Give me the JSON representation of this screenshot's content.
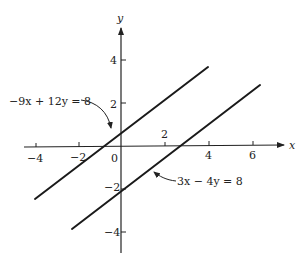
{
  "figure": {
    "axes": {
      "x_label": "x",
      "y_label": "y",
      "x_ticks": [
        {
          "value": -4,
          "label": "−4"
        },
        {
          "value": -2,
          "label": "−2"
        },
        {
          "value": 0,
          "label": "0"
        },
        {
          "value": 2,
          "label": "2"
        },
        {
          "value": 4,
          "label": "4"
        },
        {
          "value": 6,
          "label": "6"
        }
      ],
      "y_ticks": [
        {
          "value": 4,
          "label": "4"
        },
        {
          "value": 2,
          "label": "2"
        },
        {
          "value": -2,
          "label": "−2"
        },
        {
          "value": -4,
          "label": "−4"
        }
      ]
    },
    "lines": [
      {
        "equation": "−9x + 12y = 8",
        "slope": 0.75,
        "y_intercept": 0.6667,
        "x_range": [
          -4,
          4
        ]
      },
      {
        "equation": "3x − 4y = 8",
        "slope": 0.75,
        "y_intercept": -2,
        "x_range": [
          -2.2,
          6.4
        ]
      }
    ],
    "line_color": "#1a1a1a"
  }
}
